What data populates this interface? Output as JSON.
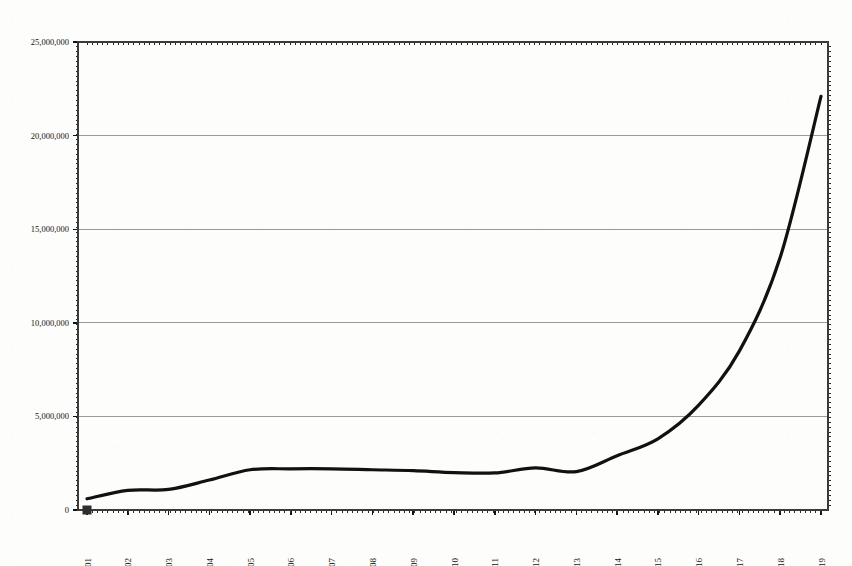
{
  "chart_data": {
    "type": "line",
    "title": "Figure 1. Growth, 1801-1819",
    "title_clipped": true,
    "xlabel": "",
    "ylabel": "",
    "x": [
      1801,
      1802,
      1803,
      1804,
      1805,
      1806,
      1807,
      1808,
      1809,
      1810,
      1811,
      1812,
      1813,
      1814,
      1815,
      1816,
      1817,
      1818,
      1819
    ],
    "categories": [
      "1801",
      "1802",
      "1803",
      "1804",
      "1805",
      "1806",
      "1807",
      "1808",
      "1809",
      "1810",
      "1811",
      "1812",
      "1813",
      "1814",
      "1815",
      "1816",
      "1817",
      "1818",
      "1819"
    ],
    "values": [
      600000,
      1050000,
      1100000,
      1600000,
      2150000,
      2200000,
      2200000,
      2150000,
      2100000,
      2000000,
      1980000,
      2250000,
      2050000,
      2900000,
      3800000,
      5600000,
      8500000,
      13500000,
      22100000
    ],
    "series": [
      {
        "name": "value",
        "values": [
          600000,
          1050000,
          1100000,
          1600000,
          2150000,
          2200000,
          2200000,
          2150000,
          2100000,
          2000000,
          1980000,
          2250000,
          2050000,
          2900000,
          3800000,
          5600000,
          8500000,
          13500000,
          22100000
        ]
      }
    ],
    "ylim": [
      0,
      25000000
    ],
    "xlim": [
      1801,
      1819
    ],
    "ytick_values": [
      0,
      5000000,
      10000000,
      15000000,
      20000000,
      25000000
    ],
    "ytick_labels": [
      "0",
      "5,000,000",
      "10,000,000",
      "15,000,000",
      "20,000,000",
      "25,000,000"
    ],
    "grid": true,
    "grid_axis": "y",
    "legend": false,
    "legend_position": "none",
    "line_color": "#111111",
    "line_width": 3.2,
    "grid_color": "#9a9a9a",
    "axis_color": "#3a3a3a",
    "background_color": "#fdfdfc",
    "marker_years": [
      "1801"
    ],
    "xtick_rotation": 90,
    "minor_ticks": true,
    "annotations": []
  },
  "figure": {
    "name": "line-chart",
    "plot_area": {
      "left": 78,
      "top": 42,
      "right": 828,
      "bottom": 510
    }
  }
}
